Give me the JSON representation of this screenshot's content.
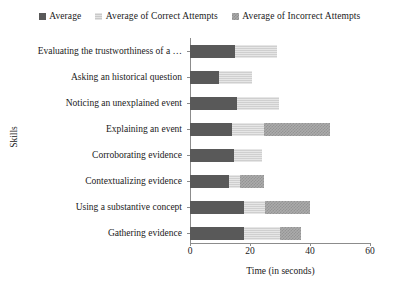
{
  "legend": {
    "items": [
      {
        "label": "Average",
        "key": "average",
        "color": "#595959",
        "icon": "square-solid-icon"
      },
      {
        "label": "Average of Correct Attempts",
        "key": "correct",
        "color": "#d9d9d9",
        "icon": "square-light-hatch-icon"
      },
      {
        "label": "Average of Incorrect Attempts",
        "key": "incorrect",
        "color": "#ababab",
        "icon": "square-cross-hatch-icon"
      }
    ]
  },
  "axes": {
    "y_title": "Skills",
    "x_title": "Time (in seconds)",
    "x_ticks": [
      "0",
      "20",
      "40",
      "60"
    ]
  },
  "chart_data": {
    "type": "bar",
    "orientation": "horizontal",
    "stacked": true,
    "title": "",
    "xlabel": "Time (in seconds)",
    "ylabel": "Skills",
    "xlim": [
      0,
      60
    ],
    "grid": false,
    "legend_position": "top",
    "categories": [
      "Evaluating the trustworthiness of a  …",
      "Asking an historical question",
      "Noticing an unexplained event",
      "Explaining an event",
      "Corroborating evidence",
      "Contextualizing evidence",
      "Using a substantive concept",
      "Gathering evidence"
    ],
    "series": [
      {
        "name": "Average",
        "values": [
          15,
          9.5,
          15.5,
          14,
          14.5,
          13,
          18,
          18
        ]
      },
      {
        "name": "Average of Correct Attempts",
        "values": [
          14,
          11,
          14,
          10.5,
          9.5,
          3.5,
          7,
          12
        ]
      },
      {
        "name": "Average of Incorrect Attempts",
        "values": [
          0,
          0,
          0,
          22,
          0,
          8,
          15,
          7
        ]
      }
    ],
    "cumulative_totals": [
      29,
      20.5,
      29.5,
      46.5,
      24,
      24.5,
      40,
      37
    ]
  }
}
